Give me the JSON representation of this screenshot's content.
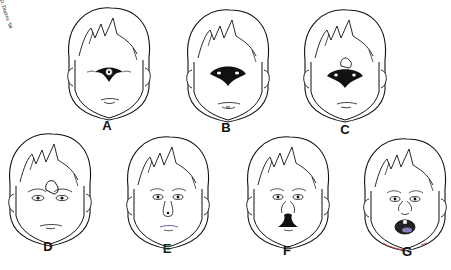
{
  "figure": {
    "panels": [
      {
        "id": "A",
        "label": "A",
        "feature": "cyclopia-single-eye-proboscis"
      },
      {
        "id": "B",
        "label": "B",
        "feature": "synophthalmia-fused-eyes"
      },
      {
        "id": "C",
        "label": "C",
        "feature": "synophthalmia-with-proboscis"
      },
      {
        "id": "D",
        "label": "D",
        "feature": "ethmocephaly-proboscis-between-eyes"
      },
      {
        "id": "E",
        "label": "E",
        "feature": "cebocephaly-single-nostril"
      },
      {
        "id": "F",
        "label": "F",
        "feature": "median-cleft-lip"
      },
      {
        "id": "G",
        "label": "G",
        "feature": "single-central-incisor-open-mouth"
      }
    ],
    "signature": "D. Duprez '94"
  }
}
